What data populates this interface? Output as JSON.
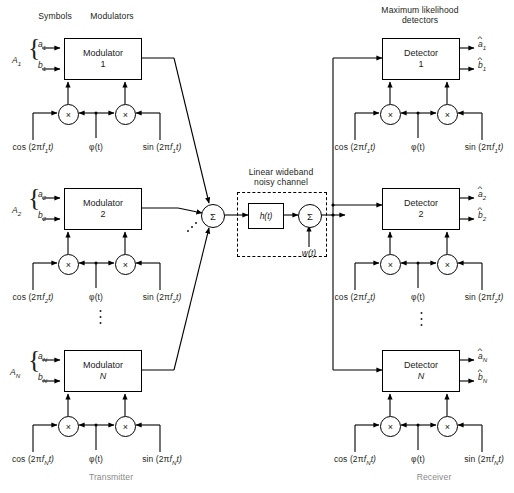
{
  "figure": {
    "headers": {
      "symbols": "Symbols",
      "modulators": "Modulators",
      "channel": [
        "Linear wideband",
        "noisy channel"
      ],
      "detectors": [
        "Maximum likelihood",
        "detectors"
      ]
    },
    "sections": {
      "transmitter": "Transmitter",
      "receiver": "Receiver"
    }
  },
  "transmitter": {
    "branches": [
      {
        "group_label": "A₁",
        "group_sub": "1",
        "in_top": "a",
        "in_top_sub": "1",
        "in_bot": "b",
        "in_bot_sub": "1",
        "block_title": "Modulator",
        "block_index": "1",
        "cos_label": "cos (2π",
        "cos_freq": "f",
        "cos_sub": "1",
        "cos_tail": "t)",
        "phase_label": "φ(t)",
        "sin_label": "sin (2π",
        "sin_freq": "f",
        "sin_sub": "1",
        "sin_tail": "t)",
        "mult_symbol": "×"
      },
      {
        "group_label": "A₂",
        "group_sub": "2",
        "in_top": "a",
        "in_top_sub": "2",
        "in_bot": "b",
        "in_bot_sub": "2",
        "block_title": "Modulator",
        "block_index": "2",
        "cos_label": "cos (2π",
        "cos_freq": "f",
        "cos_sub": "2",
        "cos_tail": "t)",
        "phase_label": "φ(t)",
        "sin_label": "sin (2π",
        "sin_freq": "f",
        "sin_sub": "2",
        "sin_tail": "t)",
        "mult_symbol": "×"
      },
      {
        "group_label": "A_N",
        "group_sub": "N",
        "in_top": "a",
        "in_top_sub": "N",
        "in_bot": "b",
        "in_bot_sub": "N",
        "block_title": "Modulator",
        "block_index": "N",
        "cos_label": "cos (2π",
        "cos_freq": "f",
        "cos_sub": "N",
        "cos_tail": "t)",
        "phase_label": "φ(t)",
        "sin_label": "sin (2π",
        "sin_freq": "f",
        "sin_sub": "N",
        "sin_tail": "t)",
        "mult_symbol": "×"
      }
    ],
    "summer_symbol": "Σ"
  },
  "channel": {
    "filter_label": "h(t)",
    "summer_symbol": "Σ",
    "noise_label": "w(t)"
  },
  "receiver": {
    "branches": [
      {
        "block_title": "Detector",
        "block_index": "1",
        "out_top": "a",
        "out_top_sub": "1",
        "out_bot": "b",
        "out_bot_sub": "1",
        "cos_label": "cos (2π",
        "cos_freq": "f",
        "cos_sub": "1",
        "cos_tail": "t)",
        "phase_label": "φ(t)",
        "sin_label": "sin (2π",
        "sin_freq": "f",
        "sin_sub": "1",
        "sin_tail": "t)",
        "mult_symbol": "×"
      },
      {
        "block_title": "Detector",
        "block_index": "2",
        "out_top": "a",
        "out_top_sub": "2",
        "out_bot": "b",
        "out_bot_sub": "2",
        "cos_label": "cos (2π",
        "cos_freq": "f",
        "cos_sub": "2",
        "cos_tail": "t)",
        "phase_label": "φ(t)",
        "sin_label": "sin (2π",
        "sin_freq": "f",
        "sin_sub": "2",
        "sin_tail": "t)",
        "mult_symbol": "×"
      },
      {
        "block_title": "Detector",
        "block_index": "N",
        "out_top": "a",
        "out_top_sub": "N",
        "out_bot": "b",
        "out_bot_sub": "N",
        "cos_label": "cos (2π",
        "cos_freq": "f",
        "cos_sub": "N",
        "cos_tail": "t)",
        "phase_label": "φ(t)",
        "sin_label": "sin (2π",
        "sin_freq": "f",
        "sin_sub": "N",
        "sin_tail": "t)",
        "mult_symbol": "×"
      }
    ]
  },
  "colors": {
    "ink": "#231f20",
    "section_label": "#8a8a8a",
    "background": "#ffffff"
  }
}
